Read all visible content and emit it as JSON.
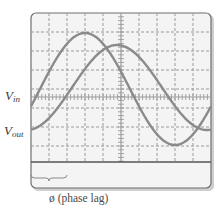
{
  "figure": {
    "type": "oscilloscope-display",
    "labels": {
      "vin_main": "V",
      "vin_sub": "in",
      "vout_main": "V",
      "vout_sub": "out"
    },
    "caption": "ø (phase lag)"
  },
  "colors": {
    "screen_bg": "#f4f4f4",
    "screen_border": "#6e6e6e",
    "grid": "#9a9a9a",
    "trace": "#8a8a8a",
    "bezel": "#d4d4d4",
    "divider": "#555555",
    "text": "#3a3a3a"
  },
  "screen": {
    "x": 31,
    "y": 13,
    "width": 180,
    "height": 175,
    "grid_cols": 10,
    "grid_rows": 8,
    "grid_step": 18,
    "center_x": 121,
    "center_y": 97,
    "divider_y": 162
  },
  "traces": [
    {
      "name": "V_in",
      "x_start": 31,
      "x_end": 211,
      "period_px": 180,
      "center_y": 89,
      "amplitude_px": 56,
      "phase_zero_x": 40
    },
    {
      "name": "V_out",
      "x_start": 31,
      "x_end": 211,
      "period_px": 180,
      "center_y": 87.5,
      "amplitude_px": 42.5,
      "phase_zero_x": 72
    }
  ],
  "brace": {
    "x1": 31,
    "x2": 67,
    "y": 178
  }
}
